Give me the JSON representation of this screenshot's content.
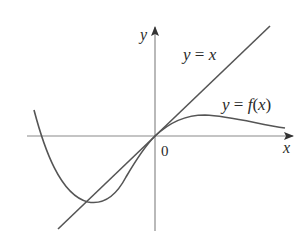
{
  "diagram": {
    "type": "function-graph",
    "axes": {
      "x_label": "x",
      "y_label": "y",
      "origin_label": "0"
    },
    "curves": [
      {
        "name": "identity-line",
        "label": "y = x",
        "label_parts": {
          "lhs": "y",
          "eq": " = ",
          "rhs": "x"
        }
      },
      {
        "name": "function-f",
        "label": "y = f(x)",
        "label_parts": {
          "lhs": "y",
          "eq": " = ",
          "fn": "f",
          "open": "(",
          "arg": "x",
          "close": ")"
        }
      }
    ],
    "colors": {
      "axis": "#8a8a8a",
      "curve": "#555555",
      "text": "#2a2a2a"
    }
  }
}
